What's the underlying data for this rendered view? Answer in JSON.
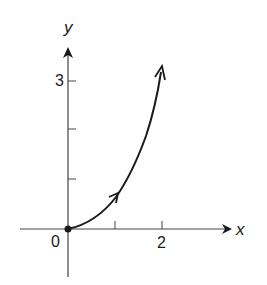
{
  "diagram": {
    "type": "parametric-curve-plot",
    "axes": {
      "x_label": "x",
      "y_label": "y",
      "origin_label": "0",
      "x_tick_labels": [
        {
          "value": 2,
          "label": "2"
        }
      ],
      "y_tick_labels": [
        {
          "value": 3,
          "label": "3"
        }
      ],
      "x_ticks": [
        1,
        2
      ],
      "y_ticks": [
        1,
        2,
        3
      ]
    },
    "curve": {
      "start_point": [
        0,
        0
      ],
      "start_marker": "filled-dot",
      "direction_arrows": [
        "mid-curve near x=1",
        "end near x=2, y≈3.3"
      ],
      "approx_points": [
        [
          0,
          0
        ],
        [
          0.5,
          0.2
        ],
        [
          1,
          0.7
        ],
        [
          1.5,
          1.9
        ],
        [
          2,
          3.3
        ]
      ]
    },
    "colors": {
      "ink": "#1a1a1a",
      "background": "#ffffff"
    }
  }
}
